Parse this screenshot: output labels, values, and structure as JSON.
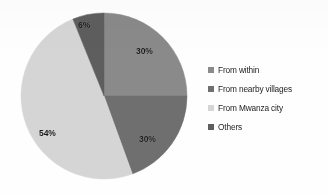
{
  "chart_data": {
    "type": "pie",
    "title": "",
    "subtitle": "",
    "xlabel": "",
    "ylabel": "",
    "grid": false,
    "legend_position": "right",
    "labels_format": "percent",
    "categories": [
      "From within",
      "From nearby villages",
      "From Mwanza city",
      "Others"
    ],
    "values": [
      30,
      30,
      54,
      6
    ],
    "value_labels": [
      "30%",
      "30%",
      "54%",
      "6%"
    ],
    "colors": [
      "#8a8a8a",
      "#6f6f6f",
      "#d5d5d5",
      "#5e5e5e"
    ],
    "slices": [
      {
        "label": "From within",
        "value": 30,
        "display": "30%",
        "color": "#8a8a8a",
        "start_angle": 0,
        "end_angle": 90
      },
      {
        "label": "From nearby villages",
        "value": 30,
        "display": "30%",
        "color": "#6f6f6f",
        "start_angle": 90,
        "end_angle": 160
      },
      {
        "label": "From Mwanza city",
        "value": 54,
        "display": "54%",
        "color": "#d5d5d5",
        "start_angle": 160,
        "end_angle": 338
      },
      {
        "label": "Others",
        "value": 6,
        "display": "6%",
        "color": "#5e5e5e",
        "start_angle": 338,
        "end_angle": 360
      }
    ]
  },
  "pie": {
    "center_x": 104,
    "center_y": 96,
    "radius": 83,
    "labels": [
      {
        "text": "30%",
        "x": 136,
        "y": 46
      },
      {
        "text": "30%",
        "x": 139,
        "y": 134
      },
      {
        "text": "54%",
        "x": 39,
        "y": 128
      },
      {
        "text": "6%",
        "x": 78,
        "y": 20
      }
    ]
  },
  "legend": {
    "items": [
      {
        "label": "From within",
        "swatch": "#8a8a8a",
        "swatch_icon": "square-swatch-icon"
      },
      {
        "label": "From nearby villages",
        "swatch": "#6f6f6f",
        "swatch_icon": "square-swatch-icon"
      },
      {
        "label": "From Mwanza city",
        "swatch": "#d5d5d5",
        "swatch_icon": "square-swatch-icon"
      },
      {
        "label": "Others",
        "swatch": "#5e5e5e",
        "swatch_icon": "square-swatch-icon"
      }
    ]
  }
}
